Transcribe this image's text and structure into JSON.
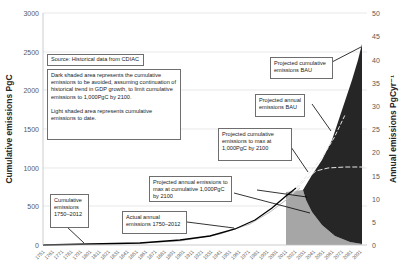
{
  "chart_data": {
    "type": "area",
    "title": "",
    "xlabel": "",
    "ylabel_left": "Cumulative emissions PgC",
    "ylabel_right": "Annual emissions PgCyr⁻¹",
    "ylim_left": [
      0,
      3000
    ],
    "ylim_right": [
      0,
      50
    ],
    "yticks_left": [
      "0",
      "500",
      "1000",
      "1500",
      "2000",
      "2500",
      "3000"
    ],
    "yticks_right": [
      "0",
      "5",
      "10",
      "15",
      "20",
      "25",
      "30",
      "35",
      "40",
      "45",
      "50"
    ],
    "x_tick_labels": [
      "1751",
      "1761",
      "1771",
      "1781",
      "1791",
      "1801",
      "1811",
      "1821",
      "1831",
      "1841",
      "1851",
      "1861",
      "1871",
      "1881",
      "1891",
      "1901",
      "1911",
      "1921",
      "1931",
      "1941",
      "1951",
      "1961",
      "1971",
      "1981",
      "1991",
      "2001",
      "2011",
      "2021",
      "2031",
      "2041",
      "2051",
      "2061",
      "2071",
      "2081",
      "2091"
    ],
    "grid": true,
    "series": [
      {
        "name": "Actual annual emissions 1750-2012",
        "axis": "right",
        "style": "solid black line",
        "x": [
          1751,
          1800,
          1850,
          1900,
          1950,
          1970,
          1990,
          2000,
          2012
        ],
        "values": [
          0.0,
          0.1,
          0.2,
          0.5,
          1.6,
          4.0,
          6.2,
          6.9,
          9.5
        ]
      },
      {
        "name": "Cumulative emissions 1750-2012",
        "axis": "left",
        "style": "light grey line",
        "x": [
          1751,
          1850,
          1900,
          1950,
          1970,
          1990,
          2012
        ],
        "values": [
          0,
          8,
          40,
          120,
          220,
          390,
          560
        ]
      },
      {
        "name": "Projected annual emissions BAU",
        "axis": "right",
        "style": "dashed white/black line",
        "x": [
          2012,
          2030,
          2050,
          2070,
          2090
        ],
        "values": [
          9.5,
          14.0,
          20.0,
          30.0,
          43.0
        ]
      },
      {
        "name": "Projected cumulative emissions BAU",
        "axis": "left",
        "style": "top of dark area",
        "x": [
          2012,
          2030,
          2050,
          2070,
          2090
        ],
        "values": [
          560,
          800,
          1200,
          1800,
          2600
        ]
      },
      {
        "name": "Projected cumulative emissions to max at 1,000PgC by 2100",
        "axis": "left",
        "style": "dashed white line",
        "x": [
          2012,
          2030,
          2040,
          2060,
          2090
        ],
        "values": [
          560,
          850,
          960,
          1000,
          1000
        ]
      },
      {
        "name": "Projected annual emissions to max at cumulative 1,000PgC by 2100",
        "axis": "right",
        "style": "boundary of light/dark area",
        "x": [
          2012,
          2020,
          2030,
          2040,
          2050,
          2070,
          2090
        ],
        "values": [
          11.5,
          11.5,
          9.0,
          5.5,
          3.0,
          1.0,
          0.2
        ]
      }
    ],
    "annotations": [
      "Source: Historical data from CDIAC",
      "Dark shaded area represents the cumulative emissions to be avoided, assuming continuation of historical trend in GDP growth, to limit cumulative emissions to 1,000PgC by 2100.",
      "Light shaded area represents cumulative emissions to date.",
      "Projected cumulative emissions BAU",
      "Projected annual emissions BAU",
      "Projected cumulative emissions to max at 1,000PgC by 2100",
      "Projected annual emissions to max at cumulative 1,000PgC by 2100",
      "Actual annual emissions 1750–2012",
      "Cumulative emissions 1750–2012"
    ],
    "colors": {
      "dark_area": "#262626",
      "light_area": "#a6a6a6",
      "actual_line": "#000000",
      "gridline": "#d9d9d9"
    }
  },
  "notes": {
    "source": "Source: Historical data  from CDIAC",
    "dark_area": "Dark shaded area represents the cumulative emissions to be avoided, assuming continuation of historical trend in GDP growth, to limit cumulative emissions to 1,000PgC by 2100.",
    "light_area": "Light shaded area represents cumulative emissions to date.",
    "proj_cum_bau": "Projected cumulative emissions  BAU",
    "proj_annual_bau": "Projected annual emissions  BAU",
    "proj_cum_max": "Projected cumulative emissions to max at 1,000PgC by 2100",
    "proj_annual_max": "Projected annual emissions  to max at cumulative 1,000PgC by 2100",
    "actual_annual": "Actual annual emissions 1750–2012",
    "cum_1750": "Cumulative emissions 1750–2012"
  }
}
